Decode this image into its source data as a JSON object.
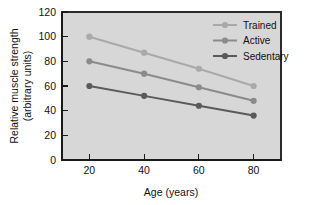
{
  "chart_data": {
    "type": "line",
    "title": "",
    "xlabel": "Age (years)",
    "ylabel": "Relative muscle strength (arbitrary units)",
    "ylabel_line1": "Relative muscle strength",
    "ylabel_line2": "(arbitrary units)",
    "x": [
      20,
      40,
      60,
      80
    ],
    "xticks": [
      "20",
      "40",
      "60",
      "80"
    ],
    "yticks": [
      "0",
      "20",
      "40",
      "60",
      "80",
      "100",
      "120"
    ],
    "xlim": [
      10,
      90
    ],
    "ylim": [
      0,
      120
    ],
    "grid": false,
    "legend_position": "top-right-inside",
    "series": [
      {
        "name": "Trained",
        "values": [
          100,
          87,
          74,
          60
        ],
        "color": "#a9a9a9"
      },
      {
        "name": "Active",
        "values": [
          80,
          70,
          59,
          48
        ],
        "color": "#8b8b8b"
      },
      {
        "name": "Sedentary",
        "values": [
          60,
          52,
          44,
          36
        ],
        "color": "#5a5a5a"
      }
    ]
  },
  "figure": {
    "plot_background": "#d7d7d7",
    "page_background": "#ffffff",
    "axis_color": "#1a1a1a"
  }
}
